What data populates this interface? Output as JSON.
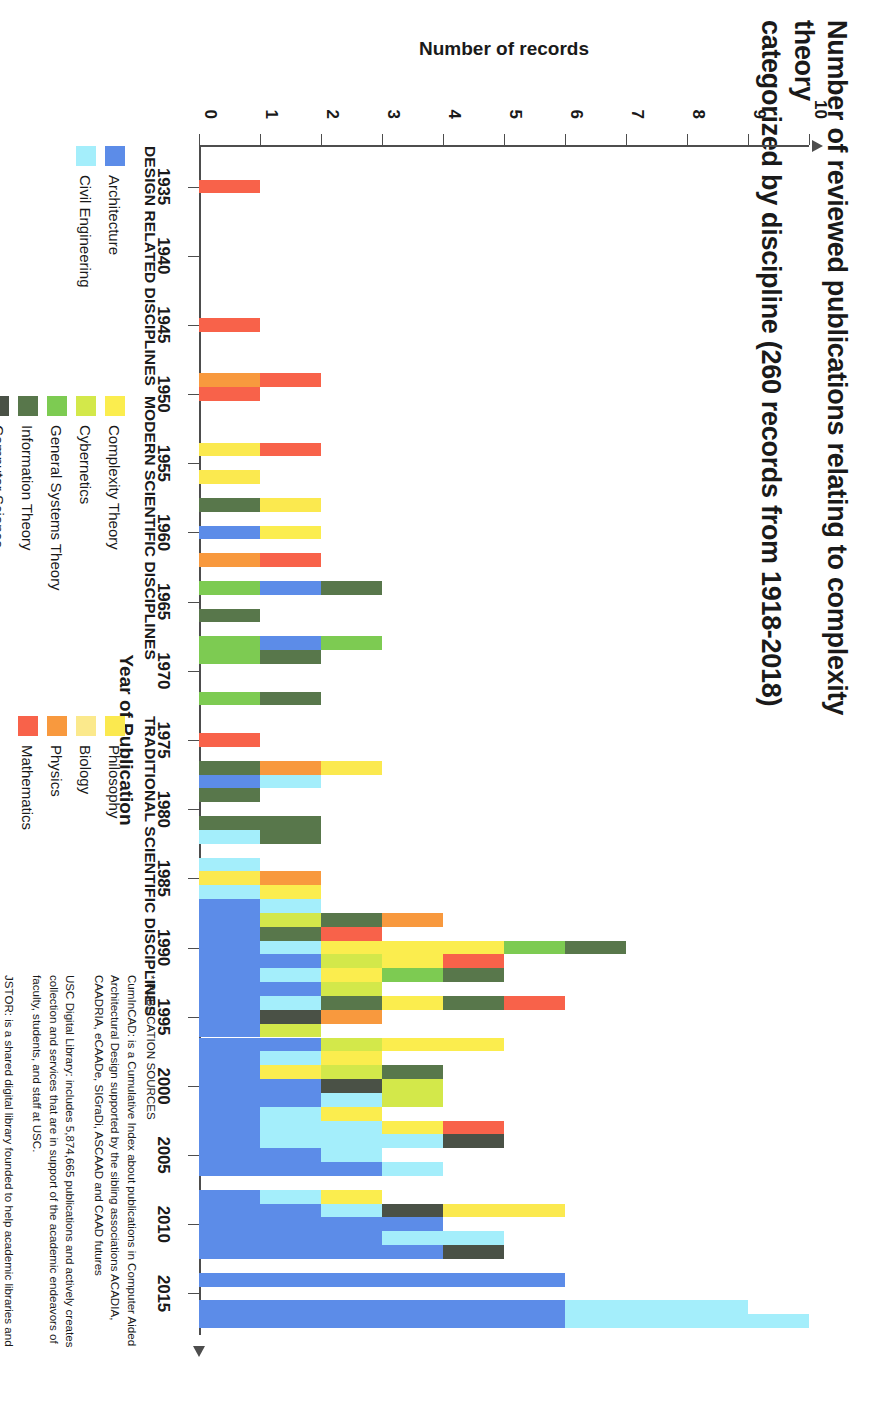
{
  "title": {
    "line1": "Number of reviewed publications relating to complexity theory",
    "line2": "categorized by discipline  (260 records from 1918-2018)"
  },
  "axes": {
    "x_title": "Year of Publication",
    "y_title": "Number of records",
    "x_ticks": [
      "1935",
      "1940",
      "1945",
      "1950",
      "1955",
      "1960",
      "1965",
      "1970",
      "1975",
      "1980",
      "1985",
      "1990",
      "1995",
      "2000",
      "2005",
      "2010",
      "2015"
    ],
    "y_ticks": [
      "0",
      "1",
      "2",
      "3",
      "4",
      "5",
      "6",
      "7",
      "8",
      "9",
      "10"
    ],
    "x_range": [
      1932,
      2018
    ],
    "y_range": [
      0,
      10
    ]
  },
  "legend": {
    "groups": [
      {
        "heading": "DESIGN RELATED DISCIPLINES",
        "items": [
          {
            "label": "Architecture",
            "color": "#5c8ce8"
          },
          {
            "label": "Civil Engineering",
            "color": "#a4eefb"
          }
        ]
      },
      {
        "heading": "MODERN SCIENTIFIC DISCIPLINES",
        "items": [
          {
            "label": "Complexity Theory",
            "color": "#fbed4e"
          },
          {
            "label": "Cybernetics",
            "color": "#d3e84a"
          },
          {
            "label": "General Systems Theory",
            "color": "#7dcb52"
          },
          {
            "label": "Information Theory",
            "color": "#58774b"
          },
          {
            "label": "Computer Science",
            "color": "#4a5146"
          }
        ]
      },
      {
        "heading": "TRADITIONAL SCIENTIFIC DISCIPLINES",
        "items": [
          {
            "label": "Philosophy",
            "color": "#fbe94f"
          },
          {
            "label": "Biology",
            "color": "#fbe98c"
          },
          {
            "label": "Physics",
            "color": "#f8993e"
          },
          {
            "label": "Mathematics",
            "color": "#f8624a"
          }
        ]
      }
    ]
  },
  "sources": {
    "heading": "* PUBLICATION SOURCES",
    "items": [
      "CumInCAD: is a Cumulative Index about publications in Computer Aided Architectural Design supported by the sibling associations ACADIA, CAADRIA, eCAADe, SIGraDi, ASCAAD and CAAD futures",
      "USC Digital Library: includes 5,874,665 publications and actively creates collection and services that are in support of the academic endeavors of faculty, students, and staff  at USC.",
      "JSTOR: is a shared digital library founded to help academic libraries and publishers."
    ]
  },
  "chart_data": {
    "type": "bar",
    "stacked": true,
    "title": "Number of reviewed publications relating to complexity theory categorized by discipline  (260 records from 1918-2018)",
    "xlabel": "Year of Publication",
    "ylabel": "Number of records",
    "xlim": [
      1932,
      2018
    ],
    "ylim": [
      0,
      10
    ],
    "grid": false,
    "legend_position": "bottom-left",
    "series_colors": {
      "Architecture": "#5c8ce8",
      "Civil Engineering": "#a4eefb",
      "Complexity Theory": "#fbed4e",
      "Cybernetics": "#d3e84a",
      "General Systems Theory": "#7dcb52",
      "Information Theory": "#58774b",
      "Computer Science": "#4a5146",
      "Philosophy": "#fbe94f",
      "Biology": "#fbe98c",
      "Physics": "#f8993e",
      "Mathematics": "#f8624a"
    },
    "bars": [
      {
        "year": 1935,
        "segments": [
          {
            "name": "Mathematics",
            "value": 1
          }
        ]
      },
      {
        "year": 1945,
        "segments": [
          {
            "name": "Mathematics",
            "value": 1
          }
        ]
      },
      {
        "year": 1949,
        "segments": [
          {
            "name": "Physics",
            "value": 1
          },
          {
            "name": "Mathematics",
            "value": 1
          }
        ]
      },
      {
        "year": 1950,
        "segments": [
          {
            "name": "Mathematics",
            "value": 1
          }
        ]
      },
      {
        "year": 1954,
        "segments": [
          {
            "name": "Philosophy",
            "value": 1
          },
          {
            "name": "Mathematics",
            "value": 1
          }
        ]
      },
      {
        "year": 1956,
        "segments": [
          {
            "name": "Philosophy",
            "value": 1
          }
        ]
      },
      {
        "year": 1958,
        "segments": [
          {
            "name": "Information Theory",
            "value": 1
          },
          {
            "name": "Philosophy",
            "value": 1
          }
        ]
      },
      {
        "year": 1960,
        "segments": [
          {
            "name": "Architecture",
            "value": 1
          },
          {
            "name": "Complexity Theory",
            "value": 1
          }
        ]
      },
      {
        "year": 1962,
        "segments": [
          {
            "name": "Physics",
            "value": 1
          },
          {
            "name": "Mathematics",
            "value": 1
          }
        ]
      },
      {
        "year": 1964,
        "segments": [
          {
            "name": "General Systems Theory",
            "value": 1
          },
          {
            "name": "Architecture",
            "value": 1
          },
          {
            "name": "Information Theory",
            "value": 1
          }
        ]
      },
      {
        "year": 1966,
        "segments": [
          {
            "name": "Information Theory",
            "value": 1
          }
        ]
      },
      {
        "year": 1968,
        "segments": [
          {
            "name": "General Systems Theory",
            "value": 1
          },
          {
            "name": "Architecture",
            "value": 1
          },
          {
            "name": "General Systems Theory",
            "value": 1
          }
        ]
      },
      {
        "year": 1969,
        "segments": [
          {
            "name": "General Systems Theory",
            "value": 1
          },
          {
            "name": "Information Theory",
            "value": 1
          }
        ]
      },
      {
        "year": 1972,
        "segments": [
          {
            "name": "General Systems Theory",
            "value": 1
          },
          {
            "name": "Information Theory",
            "value": 1
          }
        ]
      },
      {
        "year": 1975,
        "segments": [
          {
            "name": "Mathematics",
            "value": 1
          }
        ]
      },
      {
        "year": 1977,
        "segments": [
          {
            "name": "Information Theory",
            "value": 1
          },
          {
            "name": "Physics",
            "value": 1
          },
          {
            "name": "Philosophy",
            "value": 1
          }
        ]
      },
      {
        "year": 1978,
        "segments": [
          {
            "name": "Architecture",
            "value": 1
          },
          {
            "name": "Civil Engineering",
            "value": 1
          }
        ]
      },
      {
        "year": 1979,
        "segments": [
          {
            "name": "Information Theory",
            "value": 1
          }
        ]
      },
      {
        "year": 1981,
        "segments": [
          {
            "name": "Information Theory",
            "value": 2
          }
        ]
      },
      {
        "year": 1982,
        "segments": [
          {
            "name": "Civil Engineering",
            "value": 1
          },
          {
            "name": "Information Theory",
            "value": 1
          }
        ]
      },
      {
        "year": 1984,
        "segments": [
          {
            "name": "Civil Engineering",
            "value": 1
          }
        ]
      },
      {
        "year": 1985,
        "segments": [
          {
            "name": "Philosophy",
            "value": 1
          },
          {
            "name": "Physics",
            "value": 1
          }
        ]
      },
      {
        "year": 1986,
        "segments": [
          {
            "name": "Civil Engineering",
            "value": 1
          },
          {
            "name": "Complexity Theory",
            "value": 1
          }
        ]
      },
      {
        "year": 1987,
        "segments": [
          {
            "name": "Architecture",
            "value": 1
          },
          {
            "name": "Civil Engineering",
            "value": 1
          }
        ]
      },
      {
        "year": 1988,
        "segments": [
          {
            "name": "Architecture",
            "value": 1
          },
          {
            "name": "Cybernetics",
            "value": 1
          },
          {
            "name": "Information Theory",
            "value": 1
          },
          {
            "name": "Physics",
            "value": 1
          }
        ]
      },
      {
        "year": 1989,
        "segments": [
          {
            "name": "Architecture",
            "value": 1
          },
          {
            "name": "Information Theory",
            "value": 1
          },
          {
            "name": "Mathematics",
            "value": 1
          }
        ]
      },
      {
        "year": 1990,
        "segments": [
          {
            "name": "Architecture",
            "value": 1
          },
          {
            "name": "Civil Engineering",
            "value": 1
          },
          {
            "name": "Complexity Theory",
            "value": 3
          },
          {
            "name": "General Systems Theory",
            "value": 1
          },
          {
            "name": "Information Theory",
            "value": 1
          }
        ]
      },
      {
        "year": 1991,
        "segments": [
          {
            "name": "Architecture",
            "value": 2
          },
          {
            "name": "Cybernetics",
            "value": 1
          },
          {
            "name": "Complexity Theory",
            "value": 1
          },
          {
            "name": "Mathematics",
            "value": 1
          }
        ]
      },
      {
        "year": 1992,
        "segments": [
          {
            "name": "Architecture",
            "value": 1
          },
          {
            "name": "Civil Engineering",
            "value": 1
          },
          {
            "name": "Complexity Theory",
            "value": 1
          },
          {
            "name": "General Systems Theory",
            "value": 1
          },
          {
            "name": "Information Theory",
            "value": 1
          }
        ]
      },
      {
        "year": 1993,
        "segments": [
          {
            "name": "Architecture",
            "value": 2
          },
          {
            "name": "Cybernetics",
            "value": 1
          }
        ]
      },
      {
        "year": 1994,
        "segments": [
          {
            "name": "Architecture",
            "value": 1
          },
          {
            "name": "Civil Engineering",
            "value": 1
          },
          {
            "name": "Information Theory",
            "value": 1
          },
          {
            "name": "Complexity Theory",
            "value": 1
          },
          {
            "name": "Information Theory",
            "value": 1
          },
          {
            "name": "Mathematics",
            "value": 1
          }
        ]
      },
      {
        "year": 1995,
        "segments": [
          {
            "name": "Architecture",
            "value": 1
          },
          {
            "name": "Computer Science",
            "value": 1
          },
          {
            "name": "Physics",
            "value": 1
          }
        ]
      },
      {
        "year": 1996,
        "segments": [
          {
            "name": "Architecture",
            "value": 1
          },
          {
            "name": "Cybernetics",
            "value": 1
          }
        ]
      },
      {
        "year": 1997,
        "segments": [
          {
            "name": "Architecture",
            "value": 2
          },
          {
            "name": "Cybernetics",
            "value": 1
          },
          {
            "name": "Complexity Theory",
            "value": 2
          }
        ]
      },
      {
        "year": 1998,
        "segments": [
          {
            "name": "Architecture",
            "value": 1
          },
          {
            "name": "Civil Engineering",
            "value": 1
          },
          {
            "name": "Complexity Theory",
            "value": 1
          }
        ]
      },
      {
        "year": 1999,
        "segments": [
          {
            "name": "Architecture",
            "value": 1
          },
          {
            "name": "Complexity Theory",
            "value": 1
          },
          {
            "name": "Cybernetics",
            "value": 1
          },
          {
            "name": "Information Theory",
            "value": 1
          }
        ]
      },
      {
        "year": 2000,
        "segments": [
          {
            "name": "Architecture",
            "value": 2
          },
          {
            "name": "Computer Science",
            "value": 1
          },
          {
            "name": "Cybernetics",
            "value": 1
          }
        ]
      },
      {
        "year": 2001,
        "segments": [
          {
            "name": "Architecture",
            "value": 2
          },
          {
            "name": "Civil Engineering",
            "value": 1
          },
          {
            "name": "Cybernetics",
            "value": 1
          }
        ]
      },
      {
        "year": 2002,
        "segments": [
          {
            "name": "Architecture",
            "value": 1
          },
          {
            "name": "Civil Engineering",
            "value": 1
          },
          {
            "name": "Complexity Theory",
            "value": 1
          }
        ]
      },
      {
        "year": 2003,
        "segments": [
          {
            "name": "Architecture",
            "value": 1
          },
          {
            "name": "Civil Engineering",
            "value": 2
          },
          {
            "name": "Complexity Theory",
            "value": 1
          },
          {
            "name": "Mathematics",
            "value": 1
          }
        ]
      },
      {
        "year": 2004,
        "segments": [
          {
            "name": "Architecture",
            "value": 1
          },
          {
            "name": "Civil Engineering",
            "value": 3
          },
          {
            "name": "Computer Science",
            "value": 1
          }
        ]
      },
      {
        "year": 2005,
        "segments": [
          {
            "name": "Architecture",
            "value": 2
          },
          {
            "name": "Civil Engineering",
            "value": 1
          }
        ]
      },
      {
        "year": 2006,
        "segments": [
          {
            "name": "Architecture",
            "value": 3
          },
          {
            "name": "Civil Engineering",
            "value": 1
          }
        ]
      },
      {
        "year": 2008,
        "segments": [
          {
            "name": "Architecture",
            "value": 1
          },
          {
            "name": "Civil Engineering",
            "value": 1
          },
          {
            "name": "Complexity Theory",
            "value": 1
          }
        ]
      },
      {
        "year": 2009,
        "segments": [
          {
            "name": "Architecture",
            "value": 2
          },
          {
            "name": "Civil Engineering",
            "value": 1
          },
          {
            "name": "Computer Science",
            "value": 1
          },
          {
            "name": "Philosophy",
            "value": 2
          }
        ]
      },
      {
        "year": 2010,
        "segments": [
          {
            "name": "Architecture",
            "value": 4
          }
        ]
      },
      {
        "year": 2011,
        "segments": [
          {
            "name": "Architecture",
            "value": 3
          },
          {
            "name": "Civil Engineering",
            "value": 2
          }
        ]
      },
      {
        "year": 2012,
        "segments": [
          {
            "name": "Architecture",
            "value": 4
          },
          {
            "name": "Computer Science",
            "value": 1
          }
        ]
      },
      {
        "year": 2014,
        "segments": [
          {
            "name": "Architecture",
            "value": 6
          }
        ]
      },
      {
        "year": 2016,
        "segments": [
          {
            "name": "Architecture",
            "value": 6
          },
          {
            "name": "Civil Engineering",
            "value": 3
          }
        ]
      },
      {
        "year": 2017,
        "segments": [
          {
            "name": "Architecture",
            "value": 6
          },
          {
            "name": "Civil Engineering",
            "value": 4
          }
        ]
      }
    ]
  }
}
